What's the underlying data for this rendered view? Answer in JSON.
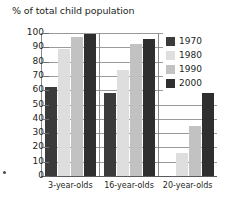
{
  "chart_data": {
    "type": "bar",
    "title": "% of total child population",
    "xlabel": "",
    "ylabel": "",
    "ylim": [
      0,
      100
    ],
    "ytick_step": 10,
    "yticks": [
      100,
      90,
      80,
      70,
      60,
      50,
      40,
      30,
      20,
      10,
      0
    ],
    "grid": true,
    "legend_position": "inside-top-right",
    "categories": [
      "3-year-olds",
      "16-year-olds",
      "20-year-olds"
    ],
    "series": [
      {
        "name": "1970",
        "color": "#3b3b3b",
        "values": [
          62,
          58,
          0
        ]
      },
      {
        "name": "1980",
        "color": "#dedede",
        "values": [
          89,
          74,
          16
        ]
      },
      {
        "name": "1990",
        "color": "#c2c2c2",
        "values": [
          97,
          92,
          35
        ]
      },
      {
        "name": "2000",
        "color": "#2f2f2f",
        "values": [
          99,
          96,
          58
        ]
      }
    ]
  },
  "legend": {
    "items": [
      {
        "label": "1970"
      },
      {
        "label": "1980"
      },
      {
        "label": "1990"
      },
      {
        "label": "2000"
      }
    ]
  }
}
